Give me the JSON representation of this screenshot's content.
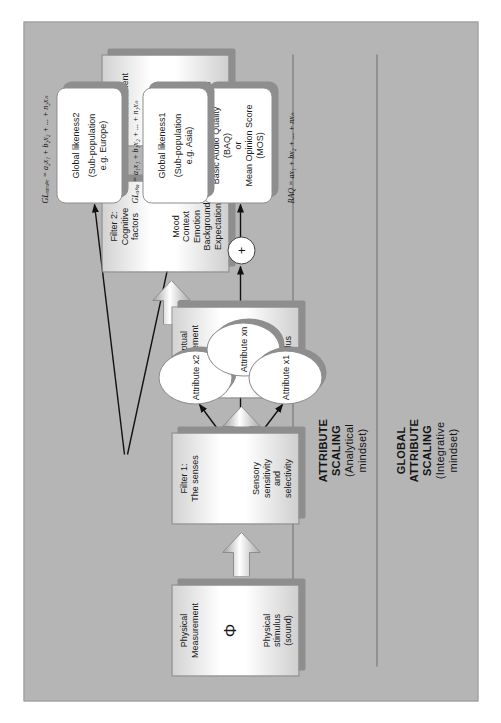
{
  "figure": {
    "background_color": "#b5b5b5",
    "page_color": "#ffffff"
  },
  "stages": [
    {
      "id": "physical-measurement",
      "title": "Physical\nMeasurement",
      "title_line1": "Physical",
      "title_line2": "Measurement",
      "symbol": "Φ",
      "sub_line1": "Physical",
      "sub_line2": "stimulus",
      "sub_line3": "(sound)"
    },
    {
      "id": "filter-1",
      "title_line1": "Filter 1:",
      "title_line2": "The senses",
      "symbol": "",
      "sub_line1": "Sensory",
      "sub_line2": "sensitivity",
      "sub_line3": "and",
      "sub_line4": "selectivity"
    },
    {
      "id": "perceptual-measurement",
      "title_line1": "Perceptual",
      "title_line2": "Measurement",
      "symbol": "Ψ",
      "sub_line1": "Perceived",
      "sub_line2": "stimulus"
    },
    {
      "id": "filter-2",
      "title_line1": "Filter 2:",
      "title_line2": "Cognitive",
      "title_line3": "factors",
      "symbol": "",
      "sub_line1": "Mood",
      "sub_line2": "Context",
      "sub_line3": "Emotion",
      "sub_line4": "Background",
      "sub_line5": "Expectation"
    },
    {
      "id": "affective-measurement",
      "title_line1": "Affective",
      "title_line2": "Measurement",
      "symbol": "",
      "sub_line1": "Preferred",
      "sub_line2": "stimulus"
    }
  ],
  "attributes": [
    {
      "id": "attribute-x2",
      "label": "Attribute x2"
    },
    {
      "id": "attribute-xn",
      "label": "Attribute xn"
    },
    {
      "id": "attribute-x1",
      "label": "Attribute x1"
    }
  ],
  "summation": {
    "label": "+"
  },
  "outputs": [
    {
      "id": "basic-audio-quality",
      "line1": "Basic Audio Quality",
      "line2": "(BAQ)",
      "line3": "or",
      "line4": "Mean Opinion Score",
      "line5": "(MOS)"
    },
    {
      "id": "global-likeness-1",
      "line1": "Global likeness1",
      "line2": "",
      "line3": "(Sub-population",
      "line4": "e.g. Asia)"
    },
    {
      "id": "global-likeness-2",
      "line1": "Global likeness2",
      "line2": "",
      "line3": "(Sub-population",
      "line4": "e.g. Europe)"
    }
  ],
  "equations": [
    {
      "id": "equation-baq",
      "text": "BAQ = ax₁ + bx₂ + ... + nxₙ"
    },
    {
      "id": "equation-gl-asia",
      "text": "GLₐₛᵢₐ = a₁x₁ + b₁x₂ + ... + n₁xₙ"
    },
    {
      "id": "equation-gl-europe",
      "text": "GLₑᵤᵣₒₚₑ = a₂x₁ + b₂x₂ + ... + n₂xₙ"
    }
  ],
  "section_labels": [
    {
      "id": "attribute-scaling",
      "line1": "ATTRIBUTE",
      "line2": "SCALING",
      "line3": "(Analytical",
      "line4": "mindset)"
    },
    {
      "id": "global-attribute-scaling",
      "line1": "GLOBAL",
      "line2": "ATTRIBUTE",
      "line3": "SCALING",
      "line4": "(Integrative",
      "line5": "mindset)"
    }
  ]
}
